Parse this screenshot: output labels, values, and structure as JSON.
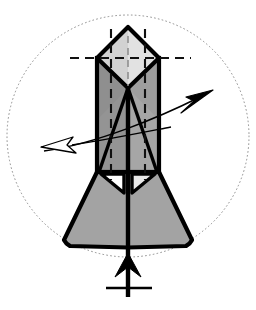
{
  "figure": {
    "title": "Crystal habit diagram with rotation axis and direction arrows",
    "canvas": {
      "width": 256,
      "height": 310,
      "background": "#ffffff"
    },
    "colors": {
      "outline": "#000000",
      "prism_face_dark": "#949494",
      "prism_face_mid": "#a8a8a8",
      "pyramid_face_light": "#d6d6d6",
      "pyramid_face_lighter": "#e2e2e2",
      "base_flare_fill": "#a3a3a3",
      "notch_white": "#ffffff",
      "dotted_circle": "#8c8c8c",
      "dashed_guide": "#111111",
      "arrow_fill_solid": "#000000",
      "arrow_fill_hollow": "#ffffff"
    },
    "elements": {
      "bounding_circle": {
        "name": "dotted-bounding-circle",
        "cx": 128,
        "cy": 136,
        "r": 121,
        "style": "dotted",
        "stroke_width": 1
      },
      "crystal": {
        "apex": {
          "x": 128,
          "y": 27
        },
        "shoulder_left": {
          "x": 97,
          "y": 58
        },
        "shoulder_right": {
          "x": 159,
          "y": 58
        },
        "inner_v_vertex": {
          "x": 128,
          "y": 88
        },
        "prism_left_x": 97,
        "prism_right_x": 159,
        "prism_top_y": 58,
        "prism_bottom_y": 172,
        "flare_bottom_y": 247,
        "flare_left_x": 64,
        "flare_right_x": 192,
        "center_x": 128
      },
      "guides": {
        "horizontal_dashed_y": 58,
        "horizontal_dashed_x1": 70,
        "horizontal_dashed_x2": 191,
        "vertical_dashed_left_x": 111,
        "vertical_dashed_right_x": 145,
        "vertical_dashed_y1": 27,
        "vertical_dashed_y2": 180,
        "center_dashed_x": 128
      },
      "arrow_right": {
        "name": "solid-arrow-up-right",
        "tail": {
          "x": 48,
          "y": 150
        },
        "tip": {
          "x": 213,
          "y": 90
        },
        "head_style": "solid-filled",
        "label": ""
      },
      "arrow_left": {
        "name": "hollow-arrow-left",
        "tail": {
          "x": 168,
          "y": 128
        },
        "tip": {
          "x": 41,
          "y": 147
        },
        "head_style": "hollow-outline",
        "label": ""
      },
      "axis_arrow_bottom": {
        "name": "rotation-axis-arrow-up",
        "shaft_x": 128,
        "shaft_top_y": 88,
        "shaft_bottom_y": 297,
        "head_tip": {
          "x": 128,
          "y": 253
        },
        "head_bottom_y": 277,
        "head_half_width": 13,
        "head_style": "barbed-solid",
        "crossbar": {
          "y": 288,
          "x1": 106,
          "x2": 152
        },
        "label": ""
      }
    },
    "annotations": []
  }
}
